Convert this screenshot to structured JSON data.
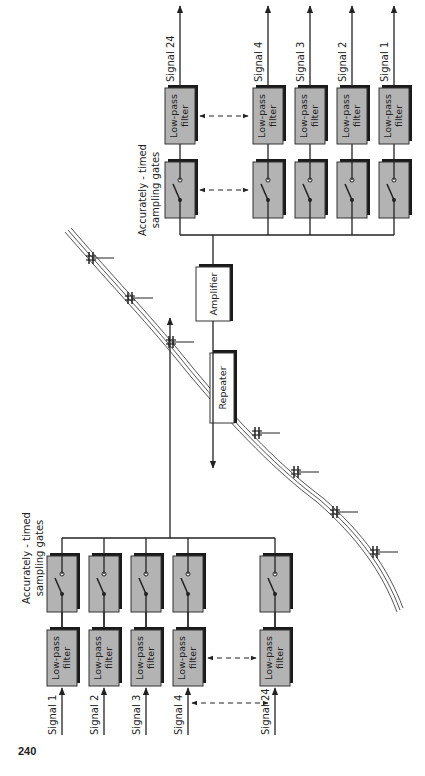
{
  "page_number": "240",
  "labels": {
    "low_pass": [
      "Low-pass",
      "filter"
    ],
    "sampling_gates": [
      "Accurately - timed",
      "sampling gates"
    ],
    "repeater": "Repeater",
    "amplifier": "Amplifier"
  },
  "transmit_bank": {
    "signals": [
      "Signal 1",
      "Signal 2",
      "Signal 3",
      "Signal 4",
      "Signal 24"
    ]
  },
  "receive_bank": {
    "signals": [
      "Signal 24",
      "Signal 4",
      "Signal 3",
      "Signal 2",
      "Signal 1"
    ]
  },
  "colors": {
    "box_fill": "#b3b3b3",
    "line": "#222222",
    "background": "#ffffff"
  }
}
